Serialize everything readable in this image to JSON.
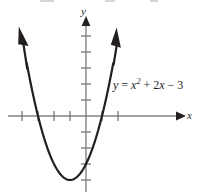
{
  "figure": {
    "width": 198,
    "height": 194,
    "background_color": "#ffffff",
    "axis_color": "#808285",
    "curve_color": "#231f20",
    "text_color": "#231f20",
    "y_axis_label": "y",
    "x_axis_label": "x",
    "equation": {
      "lhs": "y",
      "equals": " = ",
      "term1_base": "x",
      "term1_exp": "2",
      "term2": " + 2",
      "term2_var": "x",
      "term3": " − 3",
      "full_text": "y = x² + 2x − 3"
    }
  },
  "chart_data": {
    "type": "line",
    "title": "",
    "subtitle": "",
    "xlabel": "x",
    "ylabel": "y",
    "equation": "y = x^2 + 2x - 3",
    "function": "quadratic",
    "coefficients": {
      "a": 1,
      "b": 2,
      "c": -3
    },
    "vertex": [
      -1,
      -4
    ],
    "roots": [
      -3,
      1
    ],
    "y_intercept": -3,
    "axis_of_symmetry": -1,
    "opens": "upward",
    "grid": false,
    "legend": "none",
    "xlim": [
      -4.9,
      6.2
    ],
    "ylim": [
      -4.9,
      6.4
    ],
    "x_tick_values": [
      -4,
      -3,
      -2,
      -1,
      1,
      2
    ],
    "y_tick_values": [
      -4,
      -3,
      -2,
      -1,
      1,
      2,
      3,
      4,
      5
    ],
    "tick_labels_shown": false,
    "x": [
      -3.7,
      -3.5,
      -3.25,
      -3.0,
      -2.75,
      -2.5,
      -2.25,
      -2.0,
      -1.75,
      -1.5,
      -1.25,
      -1.0,
      -0.75,
      -0.5,
      -0.25,
      0.0,
      0.25,
      0.5,
      0.75,
      1.0,
      1.25,
      1.5,
      1.7
    ],
    "y": [
      3.0,
      2.25,
      1.0625,
      0.0,
      -0.9375,
      -1.75,
      -2.4375,
      -3.0,
      -3.4375,
      -3.75,
      -3.9375,
      -4.0,
      -3.9375,
      -3.75,
      -3.4375,
      -3.0,
      -2.4375,
      -1.75,
      -0.9375,
      0.0,
      1.0625,
      2.25,
      3.29
    ],
    "arrow_endpoints": [
      [
        -3.7,
        3.0
      ],
      [
        1.7,
        3.29
      ]
    ],
    "annotations": [
      {
        "text": "y = x² + 2x − 3",
        "x": 1.7,
        "y": 2.4
      }
    ]
  }
}
